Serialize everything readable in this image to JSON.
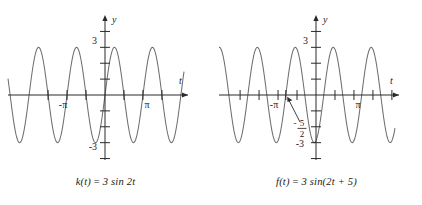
{
  "figure": {
    "background": "#ffffff",
    "curve_color": "#6f6f72",
    "axis_color": "#2a2a2a",
    "text_color": "#1b1b1b"
  },
  "panels": [
    {
      "id": "left",
      "caption_prefix": "k(t)",
      "caption_equals": " = ",
      "caption_body": "3 sin 2t",
      "caption_full": "k(t) = 3 sin 2t",
      "axis_x_label": "t",
      "axis_y_label": "y",
      "y_ticks": [
        "3",
        "-3"
      ],
      "x_ticks": [
        "-π",
        "π"
      ],
      "annotation": null,
      "chart_data": {
        "type": "line",
        "title": "k(t) = 3 sin 2t",
        "xlabel": "t",
        "ylabel": "y",
        "function": "3*sin(2*t)",
        "amplitude": 3,
        "period": 3.14159,
        "phase_shift": 0,
        "vertical_shift": 0,
        "xlim": [
          -7.6,
          7.3
        ],
        "ylim": [
          -4.6,
          4.4
        ],
        "x_tick_values": [
          -4.712,
          -3.1416,
          -1.5708,
          1.5708,
          3.1416,
          4.712
        ],
        "x_tick_labels": [
          "",
          "-π",
          "",
          "",
          "π",
          ""
        ],
        "y_tick_values": [
          -4,
          -3,
          -2,
          -1,
          1,
          2,
          3,
          4
        ],
        "y_tick_labels": [
          "",
          "-3",
          "",
          "",
          "",
          "",
          "3",
          ""
        ],
        "grid": false,
        "legend": false,
        "zero_crossings": [
          -6.2832,
          -4.712,
          -3.1416,
          -1.5708,
          0,
          1.5708,
          3.1416,
          4.712,
          6.2832
        ],
        "maxima_y": 3,
        "minima_y": -3
      }
    },
    {
      "id": "right",
      "caption_prefix": "f(t)",
      "caption_equals": " = ",
      "caption_body": "3 sin(2t + 5)",
      "caption_full": "f(t) = 3 sin(2t + 5)",
      "axis_x_label": "t",
      "axis_y_label": "y",
      "y_ticks": [
        "3",
        "-3"
      ],
      "x_ticks": [
        "-π",
        "π"
      ],
      "annotation": {
        "sign": "-",
        "numerator": "5",
        "denominator": "2",
        "text": "-5/2",
        "points_to": "x-intercept at t = -5/2"
      },
      "chart_data": {
        "type": "line",
        "title": "f(t) = 3 sin(2t + 5)",
        "xlabel": "t",
        "ylabel": "y",
        "function": "3*sin(2*t + 5)",
        "amplitude": 3,
        "period": 3.14159,
        "phase_shift": -2.5,
        "vertical_shift": 0,
        "xlim": [
          -7.6,
          7.3
        ],
        "ylim": [
          -4.6,
          4.4
        ],
        "x_tick_values": [
          -6.2832,
          -4.712,
          -3.1416,
          -2.5,
          -1.5708,
          1.5708,
          3.1416,
          4.712,
          6.2832
        ],
        "x_tick_labels": [
          "",
          "",
          "-π",
          "",
          "",
          "",
          "π",
          "",
          ""
        ],
        "y_tick_values": [
          -4,
          -3,
          -2,
          -1,
          1,
          2,
          3,
          4
        ],
        "y_tick_labels": [
          "",
          "-3",
          "",
          "",
          "",
          "",
          "3",
          ""
        ],
        "grid": false,
        "legend": false,
        "zero_crossings": [
          -5.6416,
          -4.0708,
          -2.5,
          -0.9292,
          0.6416,
          2.2124,
          3.7832,
          5.354,
          6.9248
        ],
        "maxima_y": 3,
        "minima_y": -3,
        "value_at_zero": -2.877
      }
    }
  ]
}
